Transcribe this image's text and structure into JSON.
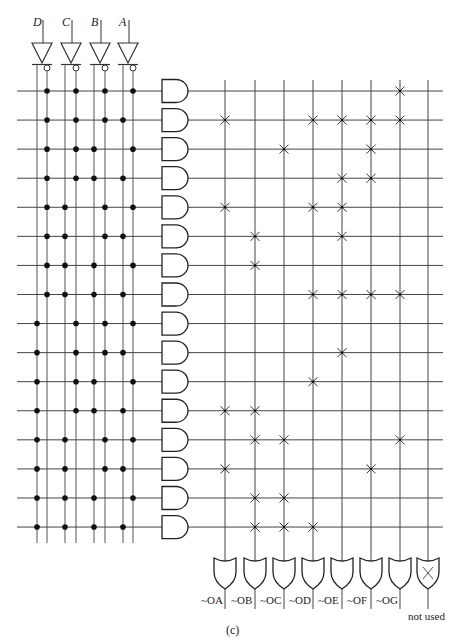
{
  "figure": {
    "caption": "(c)"
  },
  "inputs": [
    {
      "name": "D",
      "x": 42
    },
    {
      "name": "C",
      "x": 71
    },
    {
      "name": "B",
      "x": 100
    },
    {
      "name": "A",
      "x": 128
    }
  ],
  "literal_lines": {
    "order": [
      "D",
      "~D",
      "C",
      "~C",
      "B",
      "~B",
      "A",
      "~A"
    ],
    "x": [
      37,
      47,
      65,
      76,
      94,
      105,
      123,
      133
    ]
  },
  "and_plane": {
    "rows": [
      {
        "minterm": 0,
        "literals": [
          "~D",
          "~C",
          "~B",
          "~A"
        ]
      },
      {
        "minterm": 1,
        "literals": [
          "~D",
          "~C",
          "~B",
          "A"
        ]
      },
      {
        "minterm": 2,
        "literals": [
          "~D",
          "~C",
          "B",
          "~A"
        ]
      },
      {
        "minterm": 3,
        "literals": [
          "~D",
          "~C",
          "B",
          "A"
        ]
      },
      {
        "minterm": 4,
        "literals": [
          "~D",
          "C",
          "~B",
          "~A"
        ]
      },
      {
        "minterm": 5,
        "literals": [
          "~D",
          "C",
          "~B",
          "A"
        ]
      },
      {
        "minterm": 6,
        "literals": [
          "~D",
          "C",
          "B",
          "~A"
        ]
      },
      {
        "minterm": 7,
        "literals": [
          "~D",
          "C",
          "B",
          "A"
        ]
      },
      {
        "minterm": 8,
        "literals": [
          "D",
          "~C",
          "~B",
          "~A"
        ]
      },
      {
        "minterm": 9,
        "literals": [
          "D",
          "~C",
          "~B",
          "A"
        ]
      },
      {
        "minterm": 10,
        "literals": [
          "D",
          "~C",
          "B",
          "~A"
        ]
      },
      {
        "minterm": 11,
        "literals": [
          "D",
          "~C",
          "B",
          "A"
        ]
      },
      {
        "minterm": 12,
        "literals": [
          "D",
          "C",
          "~B",
          "~A"
        ]
      },
      {
        "minterm": 13,
        "literals": [
          "D",
          "C",
          "~B",
          "A"
        ]
      },
      {
        "minterm": 14,
        "literals": [
          "D",
          "C",
          "B",
          "~A"
        ]
      },
      {
        "minterm": 15,
        "literals": [
          "D",
          "C",
          "B",
          "A"
        ]
      }
    ]
  },
  "or_plane": {
    "outputs": [
      {
        "label": "~OA",
        "x": 225
      },
      {
        "label": "~OB",
        "x": 255
      },
      {
        "label": "~OC",
        "x": 284
      },
      {
        "label": "~OD",
        "x": 313
      },
      {
        "label": "~OE",
        "x": 342
      },
      {
        "label": "~OF",
        "x": 371
      },
      {
        "label": "~OG",
        "x": 400
      },
      {
        "label": "not used",
        "x": 428,
        "unused": true
      }
    ],
    "connections": [
      [
        "~OG"
      ],
      [
        "~OA",
        "~OD",
        "~OE",
        "~OF",
        "~OG"
      ],
      [
        "~OC",
        "~OF"
      ],
      [
        "~OE",
        "~OF"
      ],
      [
        "~OA",
        "~OD",
        "~OE"
      ],
      [
        "~OB",
        "~OE"
      ],
      [
        "~OB"
      ],
      [
        "~OD",
        "~OE",
        "~OF",
        "~OG"
      ],
      [],
      [
        "~OE"
      ],
      [
        "~OD"
      ],
      [
        "~OA",
        "~OB"
      ],
      [
        "~OB",
        "~OC",
        "~OG"
      ],
      [
        "~OA",
        "~OF"
      ],
      [
        "~OB",
        "~OC"
      ],
      [
        "~OB",
        "~OC",
        "~OD"
      ]
    ]
  },
  "colors": {
    "line": "#333333",
    "dot": "#111111",
    "background": "#ffffff"
  }
}
